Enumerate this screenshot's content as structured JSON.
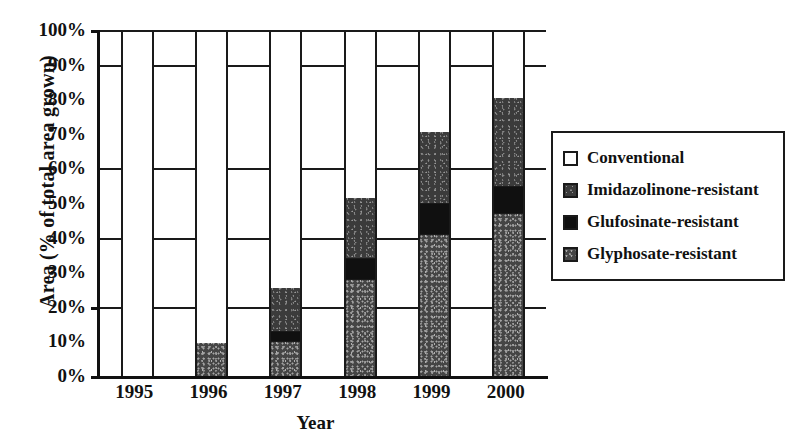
{
  "chart_data": {
    "type": "bar",
    "subtype": "stacked-bar",
    "title": "",
    "xlabel": "Year",
    "ylabel": "Area (% of total area grown)",
    "categories": [
      "1995",
      "1996",
      "1997",
      "1998",
      "1999",
      "2000"
    ],
    "ylim": [
      0,
      100
    ],
    "yticks": [
      "0%",
      "10%",
      "20%",
      "30%",
      "40%",
      "50%",
      "60%",
      "70%",
      "80%",
      "90%",
      "100%"
    ],
    "ytick_values": [
      0,
      10,
      20,
      30,
      40,
      50,
      60,
      70,
      80,
      90,
      100
    ],
    "grid": true,
    "grid_axis": "y",
    "gridline_values": [
      20,
      40,
      60,
      90,
      100
    ],
    "legend_position": "right",
    "series": [
      {
        "name": "Conventional",
        "key": "conventional",
        "color": "#ffffff",
        "pattern": "solid-white",
        "values": [
          100,
          90,
          74,
          48,
          29,
          19
        ]
      },
      {
        "name": "Imidazolinone-resistant",
        "key": "imidazolinone",
        "color": "#3b3b3b",
        "pattern": "speckled-dark",
        "values": [
          0,
          0,
          13,
          18,
          21,
          26
        ]
      },
      {
        "name": "Glufosinate-resistant",
        "key": "glufosinate",
        "color": "#101010",
        "pattern": "solid-black",
        "values": [
          0,
          0,
          3,
          6,
          9,
          8
        ]
      },
      {
        "name": "Glyphosate-resistant",
        "key": "glyphosate",
        "color": "#454545",
        "pattern": "speckled-mid",
        "values": [
          0,
          10,
          10,
          28,
          41,
          47
        ]
      }
    ],
    "stack_order_bottom_to_top": [
      "glyphosate",
      "glufosinate",
      "imidazolinone",
      "conventional"
    ],
    "bars": [
      {
        "category": "1995",
        "segments": [
          {
            "key": "glyphosate",
            "name": "Glyphosate-resistant",
            "value": 0,
            "from": 0,
            "to": 0
          },
          {
            "key": "glufosinate",
            "name": "Glufosinate-resistant",
            "value": 0,
            "from": 0,
            "to": 0
          },
          {
            "key": "imidazolinone",
            "name": "Imidazolinone-resistant",
            "value": 0,
            "from": 0,
            "to": 0
          },
          {
            "key": "conventional",
            "name": "Conventional",
            "value": 100,
            "from": 0,
            "to": 100
          }
        ]
      },
      {
        "category": "1996",
        "segments": [
          {
            "key": "glyphosate",
            "name": "Glyphosate-resistant",
            "value": 10,
            "from": 0,
            "to": 10
          },
          {
            "key": "glufosinate",
            "name": "Glufosinate-resistant",
            "value": 0,
            "from": 10,
            "to": 10
          },
          {
            "key": "imidazolinone",
            "name": "Imidazolinone-resistant",
            "value": 0,
            "from": 10,
            "to": 10
          },
          {
            "key": "conventional",
            "name": "Conventional",
            "value": 90,
            "from": 10,
            "to": 100
          }
        ]
      },
      {
        "category": "1997",
        "segments": [
          {
            "key": "glyphosate",
            "name": "Glyphosate-resistant",
            "value": 10,
            "from": 0,
            "to": 10
          },
          {
            "key": "glufosinate",
            "name": "Glufosinate-resistant",
            "value": 3,
            "from": 10,
            "to": 13
          },
          {
            "key": "imidazolinone",
            "name": "Imidazolinone-resistant",
            "value": 13,
            "from": 13,
            "to": 26
          },
          {
            "key": "conventional",
            "name": "Conventional",
            "value": 74,
            "from": 26,
            "to": 100
          }
        ]
      },
      {
        "category": "1998",
        "segments": [
          {
            "key": "glyphosate",
            "name": "Glyphosate-resistant",
            "value": 28,
            "from": 0,
            "to": 28
          },
          {
            "key": "glufosinate",
            "name": "Glufosinate-resistant",
            "value": 6,
            "from": 28,
            "to": 34
          },
          {
            "key": "imidazolinone",
            "name": "Imidazolinone-resistant",
            "value": 18,
            "from": 34,
            "to": 52
          },
          {
            "key": "conventional",
            "name": "Conventional",
            "value": 48,
            "from": 52,
            "to": 100
          }
        ]
      },
      {
        "category": "1999",
        "segments": [
          {
            "key": "glyphosate",
            "name": "Glyphosate-resistant",
            "value": 41,
            "from": 0,
            "to": 41
          },
          {
            "key": "glufosinate",
            "name": "Glufosinate-resistant",
            "value": 9,
            "from": 41,
            "to": 50
          },
          {
            "key": "imidazolinone",
            "name": "Imidazolinone-resistant",
            "value": 21,
            "from": 50,
            "to": 71
          },
          {
            "key": "conventional",
            "name": "Conventional",
            "value": 29,
            "from": 71,
            "to": 100
          }
        ]
      },
      {
        "category": "2000",
        "segments": [
          {
            "key": "glyphosate",
            "name": "Glyphosate-resistant",
            "value": 47,
            "from": 0,
            "to": 47
          },
          {
            "key": "glufosinate",
            "name": "Glufosinate-resistant",
            "value": 8,
            "from": 47,
            "to": 55
          },
          {
            "key": "imidazolinone",
            "name": "Imidazolinone-resistant",
            "value": 26,
            "from": 55,
            "to": 81
          },
          {
            "key": "conventional",
            "name": "Conventional",
            "value": 19,
            "from": 81,
            "to": 100
          }
        ]
      }
    ]
  },
  "legend": {
    "items": [
      {
        "label": "Conventional",
        "key": "conventional"
      },
      {
        "label": "Imidazolinone-resistant",
        "key": "imidazolinone"
      },
      {
        "label": "Glufosinate-resistant",
        "key": "glufosinate"
      },
      {
        "label": "Glyphosate-resistant",
        "key": "glyphosate"
      }
    ]
  }
}
